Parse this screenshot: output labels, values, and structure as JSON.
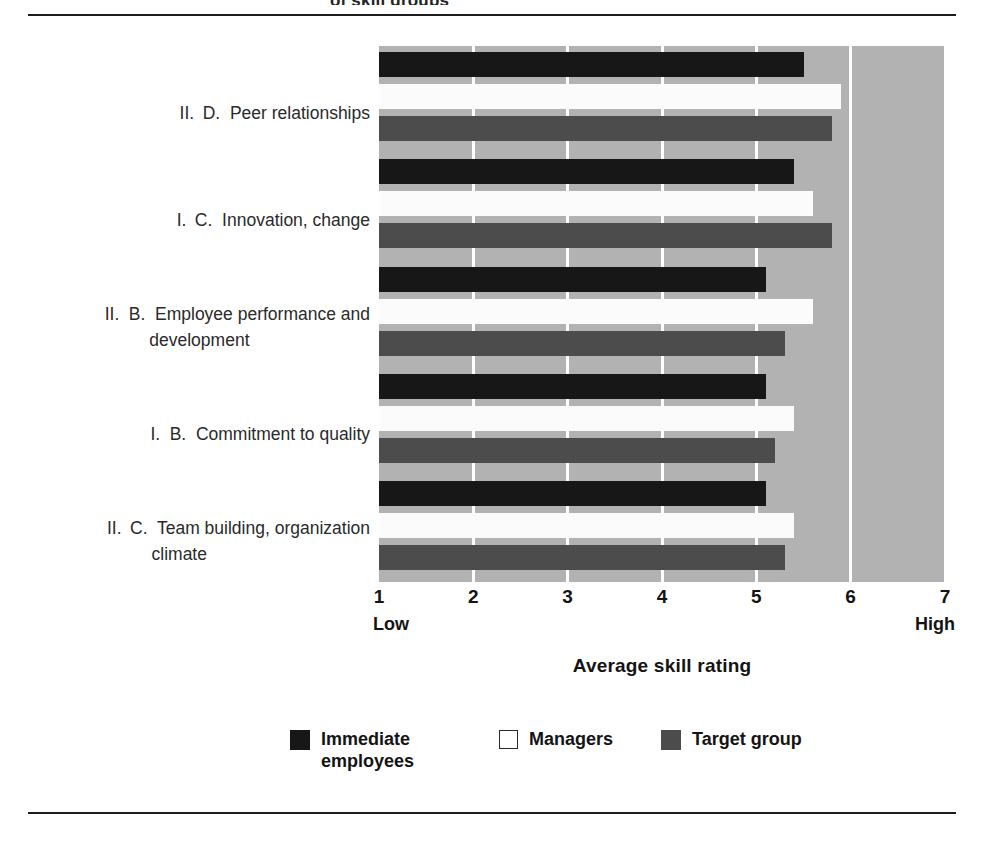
{
  "figure": {
    "clipped_header": "of skill groups",
    "xlabel": "Average skill rating",
    "axis_low_cap": "Low",
    "axis_high_cap": "High"
  },
  "legend": {
    "items": [
      {
        "name": "immediate-employees",
        "label": "Immediate employees",
        "swatch": "s-black",
        "color": "#171717"
      },
      {
        "name": "managers",
        "label": "Managers",
        "swatch": "s-white",
        "color": "#ffffff"
      },
      {
        "name": "target-group",
        "label": "Target group",
        "swatch": "s-gray",
        "color": "#4c4c4c"
      }
    ]
  },
  "colors": {
    "plot_background": "#b2b2b2",
    "gridline": "#ffffff",
    "immediate_employees": "#171717",
    "managers": "#fbfbfb",
    "target_group": "#4c4c4c",
    "text": "#141414",
    "rule": "#1d1d1d"
  },
  "categories_display": [
    {
      "roman": "II.",
      "letter": "D.",
      "line1": "Peer relationships",
      "line2": ""
    },
    {
      "roman": "I.",
      "letter": "C.",
      "line1": "Innovation, change",
      "line2": ""
    },
    {
      "roman": "II.",
      "letter": "B.",
      "line1": "Employee performance and",
      "line2": "development"
    },
    {
      "roman": "I.",
      "letter": "B.",
      "line1": "Commitment to quality",
      "line2": ""
    },
    {
      "roman": "II.",
      "letter": "C.",
      "line1": "Team building, organization",
      "line2": "climate"
    }
  ],
  "chart_data": {
    "type": "bar",
    "orientation": "horizontal",
    "title": "",
    "xlabel": "Average skill rating",
    "ylabel": "",
    "xlim": [
      1,
      7
    ],
    "xticks": [
      1,
      2,
      3,
      4,
      5,
      6,
      7
    ],
    "xticklabels": [
      "1",
      "2",
      "3",
      "4",
      "5",
      "6",
      "7"
    ],
    "xtick_endpoint_labels": {
      "1": "Low",
      "7": "High"
    },
    "grid": true,
    "grid_axis": "x",
    "legend_position": "bottom",
    "categories": [
      "II. D. Peer relationships",
      "I. C. Innovation, change",
      "II. B. Employee performance and development",
      "I. B. Commitment to quality",
      "II. C. Team building, organization climate"
    ],
    "series": [
      {
        "name": "Immediate employees",
        "color": "#171717",
        "values": [
          5.5,
          5.4,
          5.1,
          5.1,
          5.1
        ]
      },
      {
        "name": "Managers",
        "color": "#fbfbfb",
        "values": [
          5.9,
          5.6,
          5.6,
          5.4,
          5.4
        ]
      },
      {
        "name": "Target group",
        "color": "#4c4c4c",
        "values": [
          5.8,
          5.8,
          5.3,
          5.2,
          5.3
        ]
      }
    ]
  }
}
